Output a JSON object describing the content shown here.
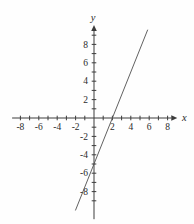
{
  "chart_data": {
    "type": "line",
    "title": "",
    "xlabel": "x",
    "ylabel": "y",
    "xlim": [
      -8.9,
      9.0
    ],
    "ylim": [
      -11.0,
      10.0
    ],
    "grid": false,
    "legend": false,
    "tick_step": 1,
    "x_tick_range": [
      -8,
      8
    ],
    "y_tick_range": [
      -9,
      9
    ],
    "x_tick_labels": [
      "-8",
      "-6",
      "-4",
      "-2",
      "2",
      "4",
      "6",
      "8"
    ],
    "x_tick_label_values": [
      -8,
      -6,
      -4,
      -2,
      2,
      4,
      6,
      8
    ],
    "y_tick_labels": [
      "8",
      "6",
      "4",
      "2",
      "-2",
      "-4",
      "-6",
      "-8"
    ],
    "y_tick_label_values": [
      8,
      6,
      4,
      2,
      -2,
      -4,
      -6,
      -8
    ],
    "series": [
      {
        "name": "line-1",
        "equation": "y = 2.5x - 5",
        "slope": 2.5,
        "y_intercept": -5,
        "x_intercept": 2,
        "segment": {
          "x1": -2.02,
          "y1": -10.05,
          "x2": 5.84,
          "y2": 9.6
        }
      }
    ]
  },
  "colors": {
    "background": "#fefefe",
    "axis": "#3c3c3c",
    "tick": "#3c3c3c",
    "line": "#4f4f4f",
    "label": "#2a2a2a"
  }
}
